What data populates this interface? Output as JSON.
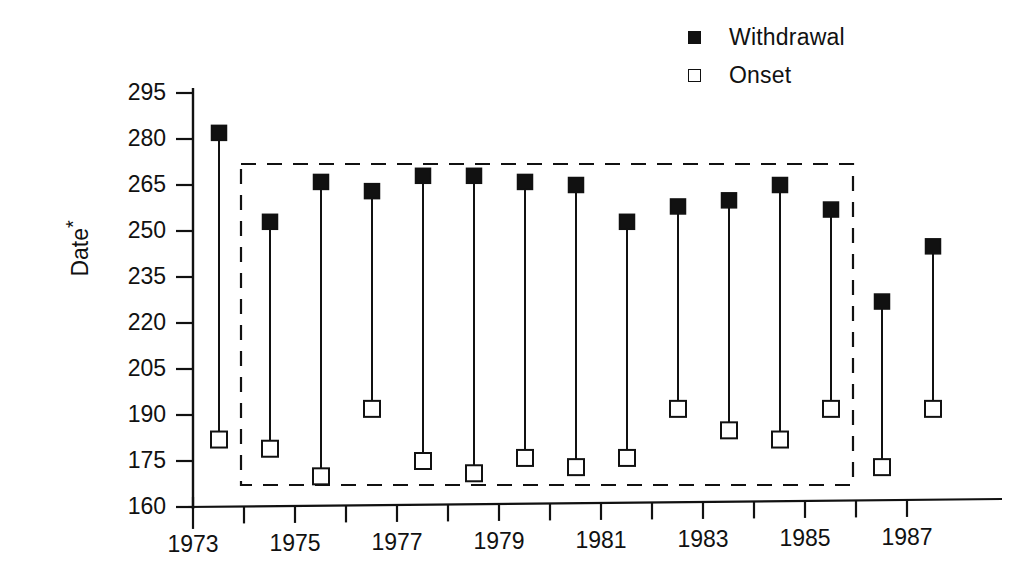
{
  "legend": {
    "position": "top-right",
    "items": [
      {
        "label": "Withdrawal",
        "marker": "filled-square",
        "color": "#111111"
      },
      {
        "label": "Onset",
        "marker": "open-square",
        "color": "#111111"
      }
    ]
  },
  "axes": {
    "ylabel": "Date",
    "ylabel_footnote": "*",
    "xlabel": ""
  },
  "annotations": [
    {
      "name": "dashed-highlight-box",
      "x_range": [
        1973.9,
        1985.9
      ],
      "y_range": [
        168,
        265
      ]
    }
  ],
  "chart_data": {
    "type": "line",
    "title": "",
    "subtitle": "",
    "xlabel": "",
    "ylabel": "Date*",
    "xlim": [
      1972.4,
      1987.8
    ],
    "ylim": [
      160,
      298
    ],
    "yticks": [
      160,
      175,
      190,
      205,
      220,
      235,
      250,
      265,
      280,
      295
    ],
    "ytick_labels": [
      "160",
      "175",
      "190",
      "205",
      "220",
      "235",
      "250",
      "265",
      "280",
      "295"
    ],
    "xticks": [
      1973,
      1974,
      1975,
      1976,
      1977,
      1978,
      1979,
      1980,
      1981,
      1982,
      1983,
      1984,
      1985,
      1986,
      1987
    ],
    "xtick_labels": [
      "1973",
      "",
      "1975",
      "",
      "1977",
      "",
      "1979",
      "",
      "1981",
      "",
      "1983",
      "",
      "1985",
      "",
      "1987"
    ],
    "x": [
      1973,
      1974,
      1975,
      1976,
      1977,
      1978,
      1979,
      1980,
      1981,
      1982,
      1983,
      1984,
      1985,
      1986,
      1987
    ],
    "grid": false,
    "legend_position": "top-right",
    "series": [
      {
        "name": "Withdrawal",
        "marker": "filled-square",
        "values": [
          282,
          253,
          266,
          263,
          268,
          268,
          266,
          265,
          253,
          258,
          260,
          265,
          257,
          227,
          245
        ]
      },
      {
        "name": "Onset",
        "marker": "open-square",
        "values": [
          182,
          179,
          170,
          192,
          175,
          171,
          176,
          173,
          176,
          192,
          185,
          182,
          192,
          173,
          192
        ]
      }
    ]
  }
}
